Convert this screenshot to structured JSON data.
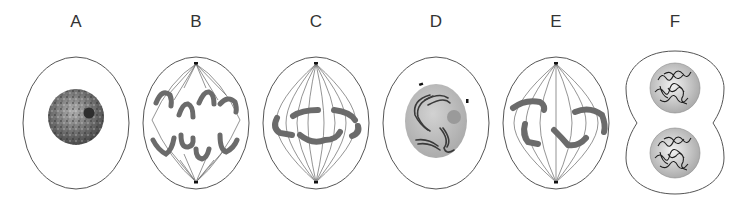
{
  "figure": {
    "stages": [
      {
        "label": "A",
        "depicts": "Interphase: cell with intact nucleus, granular chromatin and nucleolus"
      },
      {
        "label": "B",
        "depicts": "Anaphase: chromosomes pulled toward opposite spindle poles"
      },
      {
        "label": "C",
        "depicts": "Metaphase: chromosomes aligned at equator with spindle fibers"
      },
      {
        "label": "D",
        "depicts": "Prophase: condensing chromosomes in nucleus with nucleolus, centrosomes near nucleus"
      },
      {
        "label": "E",
        "depicts": "Prometaphase: chromosomes attached to spindle fibers, nuclear envelope gone"
      },
      {
        "label": "F",
        "depicts": "Telophase/cytokinesis: cleavage furrow with two daughter nuclei"
      }
    ],
    "colors": {
      "outline": "#555555",
      "chromosome": "#6b6b6b",
      "nucleus_fill": "#bcbcbc",
      "chromatin": "#222222",
      "spindle": "#666666"
    }
  }
}
